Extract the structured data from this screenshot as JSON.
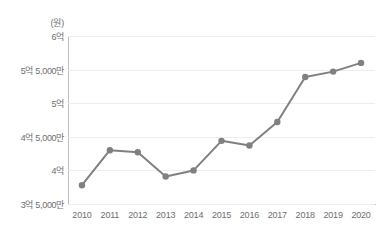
{
  "chart_data": {
    "type": "line",
    "title": "",
    "subtitle": "",
    "xlabel": "",
    "ylabel": "",
    "unit_label": "(원)",
    "categories": [
      "2010",
      "2011",
      "2012",
      "2013",
      "2014",
      "2015",
      "2016",
      "2017",
      "2018",
      "2019",
      "2020"
    ],
    "values": [
      378000000,
      430000000,
      427000000,
      391000000,
      400000000,
      444000000,
      437000000,
      472000000,
      539000000,
      547000000,
      560000000
    ],
    "value_labels": [
      "3억 7,800만",
      "4억 3,000만",
      "4억 2,700만",
      "3억 9,100만",
      "4억",
      "4억 4,400만",
      "4억 3,700만",
      "4억 7,200만",
      "5억 3,900만",
      "5억 4,700만",
      "5억 6,000만"
    ],
    "ylim": [
      350000000,
      600000000
    ],
    "y_ticks": [
      600000000,
      550000000,
      500000000,
      450000000,
      400000000,
      350000000
    ],
    "y_tick_labels": [
      "6억",
      "5억 5,000만",
      "5억",
      "4억 5,000만",
      "4억",
      "3억 5,000만"
    ],
    "grid": true,
    "grid_axis": "y",
    "legend": false,
    "legend_position": "none",
    "series": [
      {
        "name": "",
        "values": [
          378000000,
          430000000,
          427000000,
          391000000,
          400000000,
          444000000,
          437000000,
          472000000,
          539000000,
          547000000,
          560000000
        ]
      }
    ],
    "colors": {
      "line": "#808080",
      "marker": "#808080",
      "grid": "#ededed",
      "axis": "#bdbdbd",
      "tick_text": "#6e6e6e",
      "background": "#ffffff"
    },
    "style": {
      "line_width": 2,
      "marker_radius": 3.2,
      "marker_shape": "circle"
    }
  }
}
